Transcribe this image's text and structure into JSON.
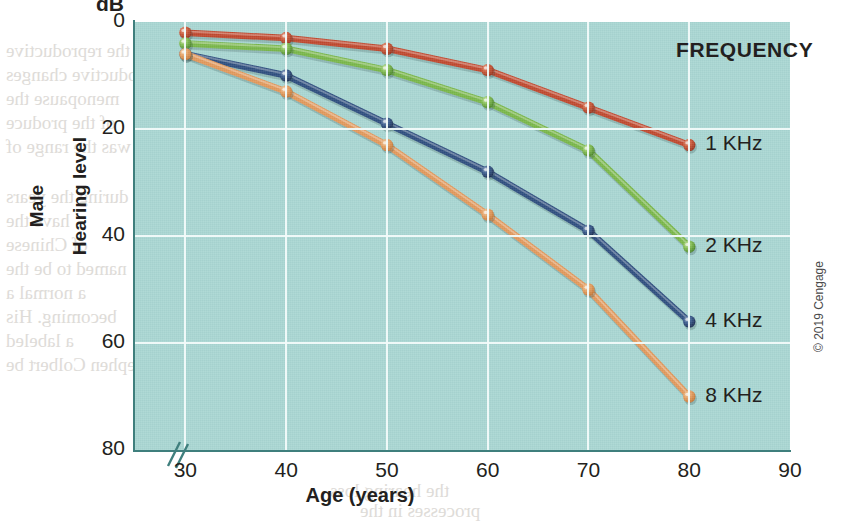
{
  "figure": {
    "unit_label": "dB",
    "copyright": "© 2019 Cengage"
  },
  "axes": {
    "y_axis_title_top": "Male",
    "y_axis_title_bottom": "Hearing level",
    "x_axis_title": "Age (years)",
    "y_ticks": [
      "0",
      "20",
      "40",
      "60",
      "80"
    ],
    "x_ticks": [
      "30",
      "40",
      "50",
      "60",
      "70",
      "80",
      "90"
    ],
    "axis_break_marker": "//"
  },
  "legend": {
    "title": "FREQUENCY",
    "entries": [
      {
        "label": "1 KHz",
        "color": "#c0492f"
      },
      {
        "label": "2 KHz",
        "color": "#79b74a"
      },
      {
        "label": "4 KHz",
        "color": "#2f4f7f"
      },
      {
        "label": "8 KHz",
        "color": "#e2995c"
      }
    ]
  },
  "colors": {
    "panel_background": "#a9d6d2",
    "gridline": "#f2fbfa",
    "axis": "#3f7f7d",
    "text": "#231f20"
  },
  "chart_data": {
    "type": "line",
    "title": "",
    "subtitle": "",
    "xlabel": "Age (years)",
    "ylabel": "Male Hearing level",
    "yunit": "dB",
    "x": [
      30,
      40,
      50,
      60,
      70,
      80
    ],
    "xlim": [
      25,
      90
    ],
    "ylim": [
      0,
      80
    ],
    "y_inverted": true,
    "grid": true,
    "legend_position": "inside-right",
    "legend_title": "FREQUENCY",
    "series": [
      {
        "name": "1 KHz",
        "color": "#c0492f",
        "values": [
          2,
          3,
          5,
          9,
          16,
          23
        ]
      },
      {
        "name": "2 KHz",
        "color": "#79b74a",
        "values": [
          4,
          5,
          9,
          15,
          24,
          42
        ]
      },
      {
        "name": "4 KHz",
        "color": "#2f4f7f",
        "values": [
          6,
          10,
          19,
          28,
          39,
          56
        ]
      },
      {
        "name": "8 KHz",
        "color": "#e2995c",
        "values": [
          6,
          13,
          23,
          36,
          50,
          70
        ]
      }
    ]
  },
  "bleed_text": [
    {
      "text": "the reproductive",
      "x": 6,
      "y": 40
    },
    {
      "text": "reproductive changes",
      "x": 6,
      "y": 64
    },
    {
      "text": "menopause the",
      "x": 6,
      "y": 88
    },
    {
      "text": "of the produce",
      "x": 6,
      "y": 112
    },
    {
      "text": "was the range of",
      "x": 6,
      "y": 136
    },
    {
      "text": "during the years",
      "x": 6,
      "y": 186
    },
    {
      "text": "have the",
      "x": 6,
      "y": 210
    },
    {
      "text": "of Chinese",
      "x": 6,
      "y": 234
    },
    {
      "text": "named to be the",
      "x": 6,
      "y": 258
    },
    {
      "text": "a normal a",
      "x": 6,
      "y": 282
    },
    {
      "text": "becoming. His",
      "x": 6,
      "y": 306
    },
    {
      "text": "a labeled",
      "x": 6,
      "y": 330
    },
    {
      "text": "Stephen Colbert be",
      "x": 6,
      "y": 354
    },
    {
      "text": "sensory ability of",
      "x": 310,
      "y": 40
    },
    {
      "text": "the hearing loss",
      "x": 330,
      "y": 480
    },
    {
      "text": "processes in the",
      "x": 360,
      "y": 500
    }
  ]
}
